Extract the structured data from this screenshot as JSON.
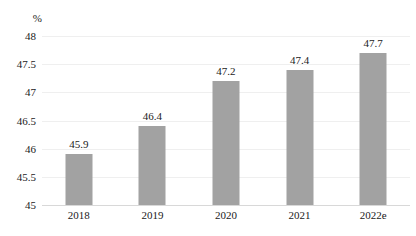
{
  "chart_data": {
    "type": "bar",
    "title": "",
    "subtitle": "",
    "xlabel": "",
    "ylabel": "%",
    "unit_label": "%",
    "categories": [
      "2018",
      "2019",
      "2020",
      "2021",
      "2022e"
    ],
    "values": [
      45.9,
      46.4,
      47.2,
      47.4,
      47.7
    ],
    "value_labels": [
      "45.9",
      "46.4",
      "47.2",
      "47.4",
      "47.7"
    ],
    "series": [
      {
        "name": "",
        "values": [
          45.9,
          46.4,
          47.2,
          47.4,
          47.7
        ]
      }
    ],
    "ylim": [
      45,
      48
    ],
    "ytick_values": [
      45,
      45.5,
      46,
      46.5,
      47,
      47.5,
      48
    ],
    "ytick_labels": [
      "45",
      "45.5",
      "46",
      "46.5",
      "47",
      "47.5",
      "48"
    ],
    "grid": true,
    "grid_axis": "y",
    "legend": false,
    "legend_position": "none",
    "bar_color": "#a2a2a2",
    "grid_color": "#efefef",
    "axis_color": "#d8d8d8",
    "text_color": "#1a1a1a",
    "background_color": "#ffffff"
  }
}
